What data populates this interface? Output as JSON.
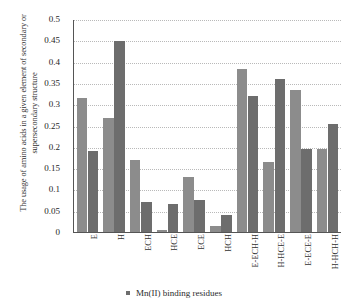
{
  "chart_data": {
    "type": "bar",
    "title": "",
    "xlabel": "",
    "ylabel": "The usage of amino acids in a given element of secondary or supersecondary structure",
    "ylim": [
      0,
      0.5
    ],
    "yticks": [
      "0",
      "0.05",
      "0.1",
      "0.15",
      "0.2",
      "0.25",
      "0.3",
      "0.35",
      "0.4",
      "0.45",
      "0.5"
    ],
    "grid": true,
    "legend_position": "bottom",
    "categories": [
      "E",
      "H",
      "ECH",
      "HCE",
      "ECE",
      "HCH",
      "E-ECH-H",
      "H-HCE-E",
      "E-ECE-E",
      "H-HCH-H"
    ],
    "series": [
      {
        "name": "series-light",
        "color": "#8c8c8c",
        "values": [
          0.315,
          0.27,
          0.17,
          0.005,
          0.13,
          0.015,
          0.385,
          0.165,
          0.335,
          0.195
        ]
      },
      {
        "name": "Mn(II) binding residues",
        "color": "#6d6d6d",
        "values": [
          0.19,
          0.45,
          0.07,
          0.065,
          0.075,
          0.04,
          0.32,
          0.36,
          0.195,
          0.255
        ]
      }
    ],
    "legend": [
      {
        "label": "Mn(II) binding residues",
        "color": "#6d6d6d",
        "marker": "square"
      }
    ]
  }
}
